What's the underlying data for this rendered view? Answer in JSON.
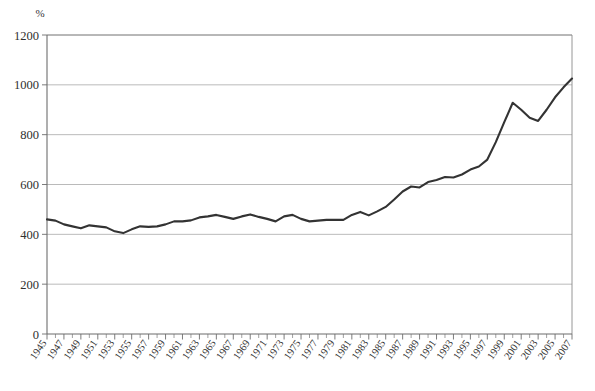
{
  "chart_data": {
    "type": "line",
    "title": "",
    "subtitle": "",
    "xlabel": "",
    "ylabel": "",
    "unit_label": "%",
    "grid": true,
    "legend": false,
    "legend_position": "none",
    "xlim": [
      1945,
      2007
    ],
    "ylim": [
      0,
      1200
    ],
    "y_ticks": [
      0,
      200,
      400,
      600,
      800,
      1000,
      1200
    ],
    "y_tick_labels": [
      "0",
      "200",
      "400",
      "600",
      "800",
      "1000",
      "1200"
    ],
    "x_tick_labels": [
      "1945",
      "1947",
      "1949",
      "1951",
      "1953",
      "1955",
      "1957",
      "1959",
      "1961",
      "1963",
      "1965",
      "1967",
      "1969",
      "1971",
      "1973",
      "1975",
      "1977",
      "1979",
      "1981",
      "1983",
      "1985",
      "1987",
      "1989",
      "1991",
      "1993",
      "1995",
      "1997",
      "1999",
      "2001",
      "2003",
      "2005",
      "2007"
    ],
    "x_tick_label_interval": 2,
    "x_minor_tick_interval": 1,
    "line_color": "#333333",
    "grid_color": "#a8a8a8",
    "x": [
      1945,
      1946,
      1947,
      1948,
      1949,
      1950,
      1951,
      1952,
      1953,
      1954,
      1955,
      1956,
      1957,
      1958,
      1959,
      1960,
      1961,
      1962,
      1963,
      1964,
      1965,
      1966,
      1967,
      1968,
      1969,
      1970,
      1971,
      1972,
      1973,
      1974,
      1975,
      1976,
      1977,
      1978,
      1979,
      1980,
      1981,
      1982,
      1983,
      1984,
      1985,
      1986,
      1987,
      1988,
      1989,
      1990,
      1991,
      1992,
      1993,
      1994,
      1995,
      1996,
      1997,
      1998,
      1999,
      2000,
      2001,
      2002,
      2003,
      2004,
      2005,
      2006,
      2007
    ],
    "series": [
      {
        "name": "value",
        "values": [
          460,
          455,
          440,
          432,
          424,
          436,
          432,
          428,
          412,
          405,
          420,
          432,
          430,
          432,
          440,
          452,
          452,
          456,
          468,
          472,
          478,
          470,
          462,
          472,
          480,
          470,
          462,
          452,
          472,
          478,
          462,
          452,
          455,
          458,
          458,
          458,
          478,
          490,
          476,
          492,
          510,
          540,
          572,
          592,
          588,
          610,
          618,
          630,
          628,
          640,
          660,
          672,
          700,
          770,
          850,
          928,
          900,
          868,
          855,
          900,
          950,
          990,
          1025
        ]
      }
    ]
  }
}
